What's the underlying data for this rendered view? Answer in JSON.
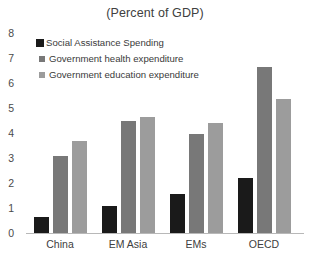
{
  "chart_data": {
    "type": "bar",
    "title": "(Percent of GDP)",
    "xlabel": "",
    "ylabel": "",
    "ylim": [
      0,
      8
    ],
    "yticks": [
      0,
      1,
      2,
      3,
      4,
      5,
      6,
      7,
      8
    ],
    "grid": false,
    "legend_position": "top-left inside plot",
    "categories": [
      "China",
      "EM Asia",
      "EMs",
      "OECD"
    ],
    "series": [
      {
        "name": "Social Assistance Spending",
        "color": "#1a1a1a",
        "values": [
          0.65,
          1.1,
          1.55,
          2.2
        ]
      },
      {
        "name": "Government health expenditure",
        "color": "#787878",
        "values": [
          3.1,
          4.5,
          3.95,
          6.65
        ]
      },
      {
        "name": "Government education expenditure",
        "color": "#9c9c9c",
        "values": [
          3.7,
          4.65,
          4.4,
          5.35
        ]
      }
    ]
  }
}
